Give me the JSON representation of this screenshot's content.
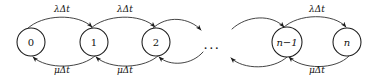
{
  "diagram": {
    "type": "state-transition-diagram",
    "background_color": "#ffffff",
    "stroke_color": "#3a3a3a",
    "node_stroke_color": "#1a1a1a",
    "text_color": "#111111",
    "states": [
      {
        "id": "s0",
        "label": "0",
        "cx": 31,
        "cy": 42,
        "r": 14,
        "italic": false
      },
      {
        "id": "s1",
        "label": "1",
        "cx": 94,
        "cy": 42,
        "r": 14,
        "italic": false
      },
      {
        "id": "s2",
        "label": "2",
        "cx": 156,
        "cy": 42,
        "r": 14,
        "italic": false
      },
      {
        "id": "sn1",
        "label": "n−1",
        "cx": 287,
        "cy": 42,
        "r": 15,
        "italic": true
      },
      {
        "id": "sn",
        "label": "n",
        "cx": 347,
        "cy": 42,
        "r": 14,
        "italic": true
      }
    ],
    "ellipsis": {
      "text": "...",
      "x": 212,
      "y": 44
    },
    "forward_rate": "λΔt",
    "backward_rate": "μΔt",
    "forward_labels": [
      {
        "text": "λΔt",
        "x": 62,
        "y": 9
      },
      {
        "text": "λΔt",
        "x": 125,
        "y": 9
      },
      {
        "text": "λΔt",
        "x": 317,
        "y": 9
      }
    ],
    "backward_labels": [
      {
        "text": "μΔt",
        "x": 62,
        "y": 70
      },
      {
        "text": "μΔt",
        "x": 125,
        "y": 70
      },
      {
        "text": "μΔt",
        "x": 317,
        "y": 70
      }
    ],
    "transitions": [
      {
        "from": "0",
        "to": "1",
        "rate": "λΔt",
        "direction": "forward"
      },
      {
        "from": "1",
        "to": "0",
        "rate": "μΔt",
        "direction": "backward"
      },
      {
        "from": "1",
        "to": "2",
        "rate": "λΔt",
        "direction": "forward"
      },
      {
        "from": "2",
        "to": "1",
        "rate": "μΔt",
        "direction": "backward"
      },
      {
        "from": "2",
        "to": "...",
        "rate": "λΔt",
        "direction": "forward"
      },
      {
        "from": "...",
        "to": "2",
        "rate": "μΔt",
        "direction": "backward"
      },
      {
        "from": "...",
        "to": "n−1",
        "rate": "λΔt",
        "direction": "forward"
      },
      {
        "from": "n−1",
        "to": "...",
        "rate": "μΔt",
        "direction": "backward"
      },
      {
        "from": "n−1",
        "to": "n",
        "rate": "λΔt",
        "direction": "forward"
      },
      {
        "from": "n",
        "to": "n−1",
        "rate": "μΔt",
        "direction": "backward"
      }
    ]
  }
}
